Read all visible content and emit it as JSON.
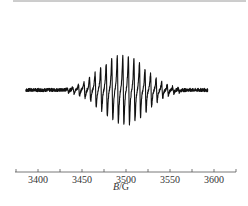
{
  "chart_data": {
    "type": "line",
    "title": "",
    "xlabel_italic": "B",
    "xlabel_rest": "/G",
    "xlabel": "B/G",
    "ylabel": "",
    "xlim": [
      3366,
      3626
    ],
    "x_ticks": [
      3400,
      3450,
      3500,
      3550,
      3600
    ],
    "minor_tick_step": 25,
    "grid": false,
    "legend": null,
    "spectrum": {
      "description": "EPR first-derivative spectrum, multi-line hyperfine pattern with Gaussian-like envelope",
      "center_field": 3497,
      "line_spacing_G": 6.3,
      "num_lines": 21,
      "envelope_sigma_G": 26,
      "trace_start_G": 3386,
      "trace_end_G": 3593,
      "relative_peak_amplitude": 1.0,
      "baseline_noise": 0.02
    }
  },
  "colors": {
    "trace": "#111111",
    "axis": "#555555",
    "top_rule": "#9a9a9a"
  }
}
